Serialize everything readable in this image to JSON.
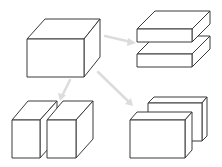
{
  "diagram": {
    "colors": {
      "line": "#3a3a3a",
      "hidden_line": "#5a5a5a",
      "arrow": "#dcdcdc",
      "background": "#ffffff"
    },
    "source": {
      "name": "whole-cuboid",
      "label": ""
    },
    "results": [
      {
        "name": "horizontal-split",
        "label": ""
      },
      {
        "name": "left-right-split",
        "label": ""
      },
      {
        "name": "front-back-split",
        "label": ""
      }
    ]
  }
}
